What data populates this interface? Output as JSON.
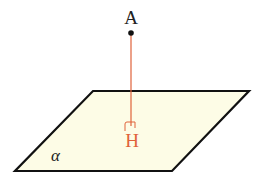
{
  "diagram": {
    "type": "geometry-perpendicular-to-plane",
    "plane": {
      "label": "α",
      "fill": "#fdfce6",
      "stroke": "#111111",
      "points": [
        [
          93,
          91
        ],
        [
          249,
          91
        ],
        [
          172,
          171
        ],
        [
          15,
          171
        ]
      ]
    },
    "point_A": {
      "label": "A",
      "x": 131,
      "y": 33,
      "color": "#111111"
    },
    "foot_H": {
      "label": "H",
      "x": 131,
      "y": 125,
      "color": "#e0623a"
    },
    "perpendicular": {
      "from": "A",
      "to": "H",
      "color": "#e0623a"
    },
    "right_angle_mark": {
      "color": "#e0623a"
    }
  }
}
